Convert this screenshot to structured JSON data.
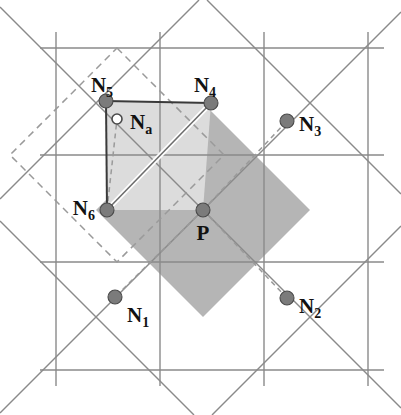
{
  "figure": {
    "width": 401,
    "height": 415,
    "background": "#ffffff"
  },
  "colors": {
    "grid_line": "#8a8a8a",
    "rot_grid_line": "#8a8a8a",
    "dashed_line": "#9a9a9a",
    "light_fill": "#dcdcdc",
    "dark_fill": "#b5b5b5",
    "node_fill": "#7b7b7b",
    "node_stroke": "#4a4a4a",
    "open_node_fill": "#ffffff",
    "label_color": "#111111",
    "connector": "#9a9a9a"
  },
  "geometry": {
    "grid_spacing": 107,
    "vertical_lines_x": [
      56,
      160,
      264,
      368
    ],
    "horizontal_lines_y": [
      48,
      155,
      262,
      370
    ],
    "rotated_grid_angle_deg": 45,
    "rotated_spacing": 107
  },
  "nodes": [
    {
      "id": "N1",
      "label": "N",
      "sub": "1",
      "x": 115,
      "y": 297,
      "type": "filled",
      "r": 7,
      "label_x": 127,
      "label_y": 322,
      "label_anchor": "start"
    },
    {
      "id": "N2",
      "label": "N",
      "sub": "2",
      "x": 287,
      "y": 298,
      "type": "filled",
      "r": 7,
      "label_x": 299,
      "label_y": 313,
      "label_anchor": "start"
    },
    {
      "id": "N3",
      "label": "N",
      "sub": "3",
      "x": 287,
      "y": 121,
      "type": "filled",
      "r": 7,
      "label_x": 299,
      "label_y": 131,
      "label_anchor": "start"
    },
    {
      "id": "N4",
      "label": "N",
      "sub": "4",
      "x": 211,
      "y": 103,
      "type": "filled",
      "r": 7,
      "label_x": 205,
      "label_y": 92,
      "label_anchor": "middle"
    },
    {
      "id": "N5",
      "label": "N",
      "sub": "5",
      "x": 106,
      "y": 101,
      "type": "filled",
      "r": 7,
      "label_x": 102,
      "label_y": 92,
      "label_anchor": "middle"
    },
    {
      "id": "N6",
      "label": "N",
      "sub": "6",
      "x": 107,
      "y": 210,
      "type": "filled",
      "r": 7,
      "label_x": 95,
      "label_y": 215,
      "label_anchor": "end"
    },
    {
      "id": "Na",
      "label": "N",
      "sub": "a",
      "x": 117,
      "y": 119,
      "type": "open",
      "r": 5,
      "label_x": 130,
      "label_y": 129,
      "label_anchor": "start"
    },
    {
      "id": "P",
      "label": "P",
      "sub": "",
      "x": 203,
      "y": 210,
      "type": "filled",
      "r": 7,
      "label_x": 203,
      "label_y": 240,
      "label_anchor": "middle"
    }
  ],
  "connectors": [
    {
      "from": "P",
      "to": "N1",
      "style": "dashed"
    },
    {
      "from": "P",
      "to": "N2",
      "style": "dashed"
    },
    {
      "from": "P",
      "to": "N3",
      "style": "dashed"
    },
    {
      "from": "N6",
      "to": "Na",
      "style": "dashed"
    },
    {
      "from": "Na",
      "to": "N5",
      "style": "none"
    }
  ],
  "polylines": {
    "light_region": "106,101 211,103 203,210 107,210",
    "solid_outline_top": "106,101 211,103",
    "solid_outline_left": "106,101 107,210",
    "dark_diamond": "203,103 310,210 203,317 96,210"
  },
  "labels": {
    "N1": "N1",
    "N2": "N2",
    "N3": "N3",
    "N4": "N4",
    "N5": "N5",
    "N6": "N6",
    "Na": "Na",
    "P": "P"
  },
  "legend": {
    "filled_node_meaning": "neighbor node",
    "open_node_meaning": "auxiliary node"
  }
}
